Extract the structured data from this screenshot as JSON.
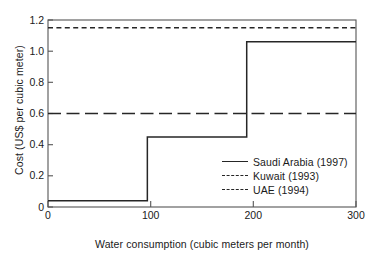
{
  "chart_data": {
    "type": "line",
    "title": "",
    "xlabel": "Water consumption (cubic meters per month)",
    "ylabel": "Cost (US$ per cubic meter)",
    "xlim": [
      0,
      310
    ],
    "ylim": [
      0,
      1.2
    ],
    "xticks": [
      0,
      100,
      200,
      300
    ],
    "xtick_labels": [
      "0",
      "100",
      "200",
      "300"
    ],
    "yticks": [
      0,
      0.2,
      0.4,
      0.6,
      0.8,
      1.0,
      1.2
    ],
    "ytick_labels": [
      "0",
      "0.2",
      "0.4",
      "0.6",
      "0.8",
      "1.0",
      "1.2"
    ],
    "grid": false,
    "legend_position": "center-right-inside",
    "line_color": "#262626",
    "frame_color": "#555555",
    "series": [
      {
        "name": "Saudi Arabia (1997)",
        "style": "solid",
        "kind": "step",
        "x": [
          0,
          100,
          100,
          200,
          200,
          310
        ],
        "y": [
          0.04,
          0.04,
          0.45,
          0.45,
          1.06,
          1.06
        ]
      },
      {
        "name": "Kuwait (1993)",
        "style": "dashed",
        "kind": "constant",
        "value": 0.6,
        "x": [
          0,
          310
        ],
        "y": [
          0.6,
          0.6
        ]
      },
      {
        "name": "UAE (1994)",
        "style": "dotted",
        "kind": "constant",
        "value": 1.15,
        "x": [
          0,
          310
        ],
        "y": [
          1.15,
          1.15
        ]
      }
    ]
  },
  "legend": {
    "items": [
      {
        "label": "Saudi Arabia (1997)",
        "style": "solid"
      },
      {
        "label": "Kuwait (1993)",
        "style": "dashed"
      },
      {
        "label": "UAE (1994)",
        "style": "dotted"
      }
    ]
  }
}
